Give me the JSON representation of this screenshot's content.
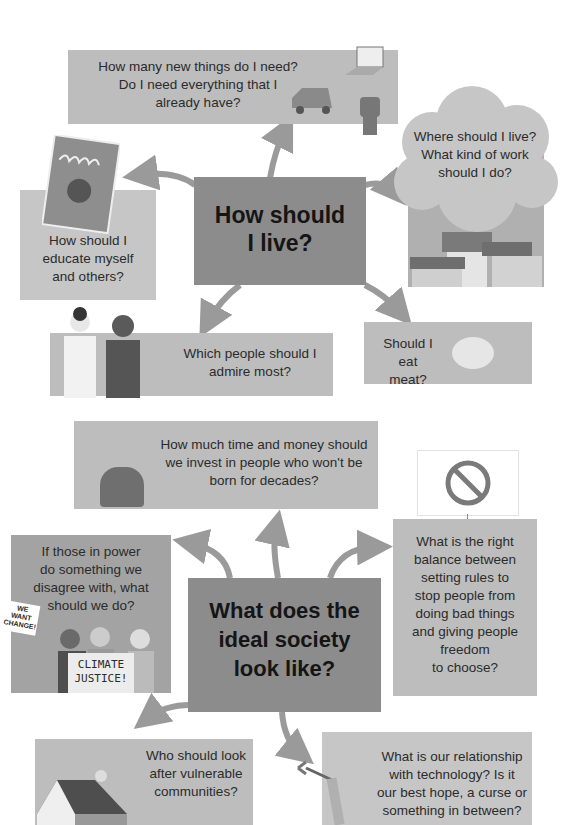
{
  "section1": {
    "hub": {
      "title_line1": "How should",
      "title_line2": "I live?"
    },
    "questions": [
      {
        "id": "things",
        "lines": [
          "How many new things do I need?",
          "Do I need everything that I",
          "already have?"
        ]
      },
      {
        "id": "live_work",
        "lines": [
          "Where should I live?",
          "What kind of work",
          "should I do?"
        ]
      },
      {
        "id": "educate",
        "lines": [
          "How should I",
          "educate myself",
          "and others?"
        ]
      },
      {
        "id": "admire",
        "lines": [
          "Which people should I",
          "admire most?"
        ]
      },
      {
        "id": "meat",
        "lines": [
          "Should I",
          "eat meat?"
        ]
      }
    ]
  },
  "section2": {
    "hub": {
      "title_line1": "What does the",
      "title_line2": "ideal society",
      "title_line3": "look like?"
    },
    "questions": [
      {
        "id": "future",
        "lines": [
          "How much time and money should",
          "we invest in people who won't be",
          "born for decades?"
        ]
      },
      {
        "id": "rules",
        "lines": [
          "What is the right",
          "balance between",
          "setting rules to",
          "stop people from",
          "doing bad things",
          "and giving people",
          "freedom",
          "to choose?"
        ]
      },
      {
        "id": "power",
        "lines": [
          "If those in power",
          "do something we",
          "disagree with, what",
          "should we do?"
        ]
      },
      {
        "id": "vulnerable",
        "lines": [
          "Who should look",
          "after vulnerable",
          "communities?"
        ]
      },
      {
        "id": "technology",
        "lines": [
          "What is our relationship",
          "with technology? Is it",
          "our best hope, a curse or",
          "something in between?"
        ]
      }
    ],
    "signs": {
      "we_want": [
        "WE",
        "WANT",
        "CHANGE!"
      ],
      "climate": [
        "CLIMATE",
        "JUSTICE!"
      ]
    }
  },
  "colors": {
    "box": "#bdbdbd",
    "hub": "#a3a3a3",
    "arrow": "#9a9a9a",
    "text": "#2b2b2b"
  }
}
